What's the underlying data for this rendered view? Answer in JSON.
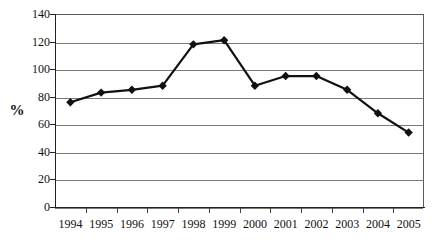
{
  "chart_data": {
    "type": "line",
    "title": "",
    "subtitle": "",
    "xlabel": "",
    "ylabel": "%",
    "categories": [
      "1994",
      "1995",
      "1996",
      "1997",
      "1998",
      "1999",
      "2000",
      "2001",
      "2002",
      "2003",
      "2004",
      "2005"
    ],
    "values": [
      76,
      83,
      85,
      88,
      118,
      121,
      88,
      95,
      95,
      85,
      68,
      54
    ],
    "series": [
      {
        "name": "",
        "values": [
          76,
          83,
          85,
          88,
          118,
          121,
          88,
          95,
          95,
          85,
          68,
          54
        ]
      }
    ],
    "ylim": [
      0,
      140
    ],
    "y_ticks": [
      0,
      20,
      40,
      60,
      80,
      100,
      120,
      140
    ],
    "y_tick_labels": [
      "0",
      "20",
      "40",
      "60",
      "80",
      "100",
      "120",
      "140"
    ],
    "grid": true,
    "legend": "none",
    "marker": "diamond",
    "line_color": "#111111",
    "marker_color": "#111111",
    "grid_color": "#7a7a7a",
    "axis_color": "#222222",
    "background": "#ffffff"
  }
}
